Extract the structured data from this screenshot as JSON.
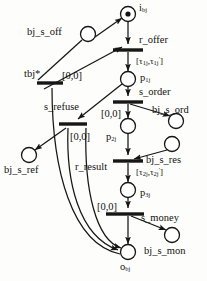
{
  "diagram": {
    "type": "petri-net",
    "places": [
      {
        "id": "i_bj",
        "label_html": "i<sub>bj</sub>",
        "label_text": "i_bj",
        "cx": 128,
        "cy": 14,
        "r": 7.5,
        "tokens": 1
      },
      {
        "id": "bj_s_off",
        "label_html": "bj_s_off",
        "label_text": "bj_s_off",
        "cx": 88,
        "cy": 34,
        "r": 7.5,
        "tokens": 0
      },
      {
        "id": "p_1j",
        "label_html": "p<sub>1j</sub>",
        "label_text": "p_1j",
        "cx": 128,
        "cy": 79,
        "r": 7.5,
        "tokens": 0
      },
      {
        "id": "bj_s_ord",
        "label_html": "bj_s_ord",
        "label_text": "bj_s_ord",
        "cx": 176,
        "cy": 121,
        "r": 7.5,
        "tokens": 0
      },
      {
        "id": "p_2j",
        "label_html": "p<sub>2j</sub>",
        "label_text": "p_2j",
        "cx": 128,
        "cy": 126,
        "r": 7.5,
        "tokens": 0
      },
      {
        "id": "bj_s_res",
        "label_html": "bj_s_res",
        "label_text": "bj_s_res",
        "cx": 172,
        "cy": 144,
        "r": 7.5,
        "tokens": 0
      },
      {
        "id": "bj_s_ref",
        "label_html": "bj_s_ref",
        "label_text": "bj_s_ref",
        "cx": 29,
        "cy": 155,
        "r": 7.5,
        "tokens": 0
      },
      {
        "id": "p_3j",
        "label_html": "p<sub>3j</sub>",
        "label_text": "p_3j",
        "cx": 128,
        "cy": 190,
        "r": 7.5,
        "tokens": 0
      },
      {
        "id": "bj_s_mon",
        "label_html": "bj_s_mon",
        "label_text": "bj_s_mon",
        "cx": 172,
        "cy": 235,
        "r": 7.5,
        "tokens": 0
      },
      {
        "id": "o_bj",
        "label_html": "o<sub>bj</sub>",
        "label_text": "o_bj",
        "cx": 128,
        "cy": 252,
        "r": 7.5,
        "tokens": 0
      }
    ],
    "transitions": [
      {
        "id": "r_offer",
        "label": "r_offer",
        "cx": 128,
        "cy": 50,
        "w": 30,
        "interval": "[τ₁ⱼ,τ₁ⱼ′]"
      },
      {
        "id": "tbj_star",
        "label": "tbj*",
        "cx": 50,
        "cy": 83,
        "w": 26,
        "interval": "[0,0]"
      },
      {
        "id": "s_order",
        "label": "s_order",
        "cx": 128,
        "cy": 102,
        "w": 30,
        "interval": "[0,0]"
      },
      {
        "id": "s_refuse",
        "label": "s_refuse",
        "cx": 72,
        "cy": 124,
        "w": 26,
        "interval": "[0,0]"
      },
      {
        "id": "r_result",
        "label": "r_result",
        "cx": 128,
        "cy": 161,
        "w": 30,
        "interval": "[τ₂ⱼ,τ₂ⱼ′]"
      },
      {
        "id": "s_money",
        "label": "s_money",
        "cx": 128,
        "cy": 214,
        "w": 30,
        "interval": "[0,0]"
      }
    ],
    "labels": [
      {
        "key": "i_bj",
        "text": "i",
        "sub": "bj",
        "x": 139,
        "y": 3,
        "cls": "nm"
      },
      {
        "key": "bj_s_off",
        "text": "bj_s_off",
        "sub": "",
        "x": 28,
        "y": 28,
        "cls": "nm"
      },
      {
        "key": "r_offer",
        "text": "r_offer",
        "sub": "",
        "x": 139,
        "y": 36,
        "cls": "nm"
      },
      {
        "key": "interval_1",
        "text": "[τ",
        "sub": "",
        "x": 137,
        "y": 57,
        "cls": "tm"
      },
      {
        "key": "tbj_star",
        "text": "tbj*",
        "sub": "",
        "x": 25,
        "y": 70,
        "cls": "nm"
      },
      {
        "key": "zero_tbj",
        "text": "[0,0]",
        "sub": "",
        "x": 63,
        "y": 72,
        "cls": "nm"
      },
      {
        "key": "p_1j",
        "text": "p",
        "sub": "1j",
        "x": 141,
        "y": 74,
        "cls": "nm"
      },
      {
        "key": "s_order",
        "text": "s_order",
        "sub": "",
        "x": 139,
        "y": 88,
        "cls": "nm"
      },
      {
        "key": "s_refuse",
        "text": "s_refuse",
        "sub": "",
        "x": 45,
        "y": 103,
        "cls": "nm"
      },
      {
        "key": "zero_order",
        "text": "[0,0]",
        "sub": "",
        "x": 103,
        "y": 110,
        "cls": "nm"
      },
      {
        "key": "bj_s_ord",
        "text": "bj_s_ord",
        "sub": "",
        "x": 155,
        "y": 106,
        "cls": "nm"
      },
      {
        "key": "zero_refuse",
        "text": "[0,0]",
        "sub": "",
        "x": 72,
        "y": 133,
        "cls": "nm"
      },
      {
        "key": "p_2j",
        "text": "p",
        "sub": "2j",
        "x": 108,
        "y": 133,
        "cls": "nm"
      },
      {
        "key": "bj_s_ref",
        "text": "bj_s_ref",
        "sub": "",
        "x": 6,
        "y": 166,
        "cls": "nm"
      },
      {
        "key": "r_result",
        "text": "r_result",
        "sub": "",
        "x": 77,
        "y": 163,
        "cls": "nm"
      },
      {
        "key": "bj_s_res",
        "text": "bj_s_res",
        "sub": "",
        "x": 148,
        "y": 156,
        "cls": "nm"
      },
      {
        "key": "interval_2",
        "text": "[τ",
        "sub": "",
        "x": 137,
        "y": 168,
        "cls": "tm"
      },
      {
        "key": "p_3j",
        "text": "p",
        "sub": "3j",
        "x": 141,
        "y": 189,
        "cls": "nm"
      },
      {
        "key": "zero_money",
        "text": "[0,0]",
        "sub": "",
        "x": 99,
        "y": 203,
        "cls": "nm"
      },
      {
        "key": "s_money",
        "text": "s_money",
        "sub": "",
        "x": 141,
        "y": 214,
        "cls": "nm"
      },
      {
        "key": "bj_s_mon",
        "text": "bj_s_mon",
        "sub": "",
        "x": 146,
        "y": 247,
        "cls": "nm"
      },
      {
        "key": "o_bj",
        "text": "o",
        "sub": "bj",
        "x": 122,
        "y": 263,
        "cls": "nm"
      }
    ],
    "colors": {
      "stroke": "#1a1a1a",
      "fill": "#ffffff",
      "token": "#111111",
      "background": "#fdfdfb"
    }
  }
}
